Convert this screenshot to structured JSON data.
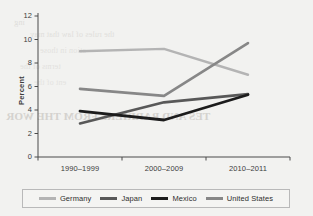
{
  "chart_data": {
    "type": "line",
    "title": "",
    "subtitle": "",
    "xlabel": "",
    "ylabel": "Percent",
    "categories": [
      "1990–1999",
      "2000–2009",
      "2010–2011"
    ],
    "ylim": [
      0,
      12
    ],
    "yticks": [
      0,
      2,
      4,
      6,
      8,
      10,
      12
    ],
    "grid": false,
    "legend_position": "bottom",
    "series": [
      {
        "name": "Germany",
        "color": "#b4b4b4",
        "width": 2.4,
        "values": [
          9.0,
          9.2,
          7.0
        ]
      },
      {
        "name": "Japan",
        "color": "#585858",
        "width": 2.6,
        "values": [
          2.85,
          4.65,
          5.35
        ]
      },
      {
        "name": "Mexico",
        "color": "#1c1c1c",
        "width": 2.8,
        "values": [
          3.9,
          3.15,
          5.3
        ]
      },
      {
        "name": "United States",
        "color": "#878787",
        "width": 2.6,
        "values": [
          5.8,
          5.2,
          9.7
        ]
      }
    ]
  },
  "axis": {
    "y_label": "Percent",
    "y_ticks": [
      "12",
      "10",
      "8",
      "6",
      "4",
      "2",
      "0"
    ],
    "x_ticks": [
      "1990–1999",
      "2000–2009",
      "2010–2011"
    ]
  },
  "legend": {
    "items": [
      {
        "label": "Germany",
        "color": "#b4b4b4"
      },
      {
        "label": "Japan",
        "color": "#585858"
      },
      {
        "label": "Mexico",
        "color": "#1c1c1c"
      },
      {
        "label": "United States",
        "color": "#878787"
      }
    ]
  },
  "background_text": {
    "line1": "TES AND BARRIERS FROM THE WOR",
    "line2": "12",
    "line3": "ing",
    "line4": "the rules of law that may",
    "line5": "ation in those",
    "line6": "terms of the",
    "line7": "ent of the"
  },
  "colors": {
    "page_background": "#f2f2f0",
    "axis": "#4a4a4a",
    "text": "#3c3c3c",
    "legend_border": "#b9b9b9"
  }
}
